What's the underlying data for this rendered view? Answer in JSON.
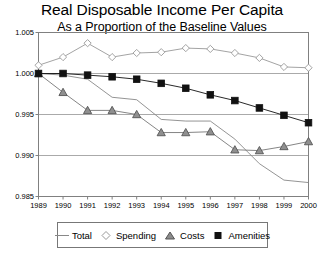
{
  "chart_data": {
    "type": "line",
    "title": "Real Disposable Income Per Capita",
    "subtitle": "As a Proportion of the Baseline Values",
    "xlabel": "",
    "ylabel": "",
    "categories": [
      "1989",
      "1990",
      "1991",
      "1992",
      "1993",
      "1994",
      "1995",
      "1996",
      "1997",
      "1998",
      "1999",
      "2000"
    ],
    "x": [
      1989,
      1990,
      1991,
      1992,
      1993,
      1994,
      1995,
      1996,
      1997,
      1998,
      1999,
      2000
    ],
    "xlim": [
      1989,
      2000
    ],
    "ylim": [
      0.985,
      1.005
    ],
    "ytick_labels": [
      "1.005",
      "1.000",
      "0.995",
      "0.990",
      "0.985"
    ],
    "ytick_values": [
      1.005,
      1.0,
      0.995,
      0.99,
      0.985
    ],
    "grid": "horizontal",
    "legend_position": "bottom",
    "series": [
      {
        "name": "Total",
        "marker": "none",
        "color": "#888888",
        "values": [
          1.0,
          0.9998,
          0.9993,
          0.9971,
          0.9968,
          0.9944,
          0.9942,
          0.9942,
          0.992,
          0.989,
          0.987,
          0.9867
        ]
      },
      {
        "name": "Spending",
        "marker": "diamond",
        "color": "#999999",
        "values": [
          1.001,
          1.002,
          1.0037,
          1.002,
          1.0025,
          1.0026,
          1.0031,
          1.003,
          1.0025,
          1.0019,
          1.0008,
          1.0007
        ]
      },
      {
        "name": "Costs",
        "marker": "triangle",
        "color": "#777777",
        "values": [
          1.0,
          0.9977,
          0.9955,
          0.9955,
          0.995,
          0.9928,
          0.9928,
          0.9929,
          0.9907,
          0.9906,
          0.9911,
          0.9917
        ]
      },
      {
        "name": "Amenities",
        "marker": "square",
        "color": "#111111",
        "values": [
          1.0,
          1.0,
          0.9998,
          0.9996,
          0.9993,
          0.9988,
          0.9982,
          0.9974,
          0.9967,
          0.9958,
          0.9949,
          0.994
        ]
      }
    ]
  },
  "legend": {
    "items": [
      {
        "label": "Total"
      },
      {
        "label": "Spending"
      },
      {
        "label": "Costs"
      },
      {
        "label": "Amenities"
      }
    ]
  },
  "colors": {
    "axis": "#808080",
    "grid": "#aaaaaa",
    "background": "#ffffff",
    "text": "#000000"
  }
}
